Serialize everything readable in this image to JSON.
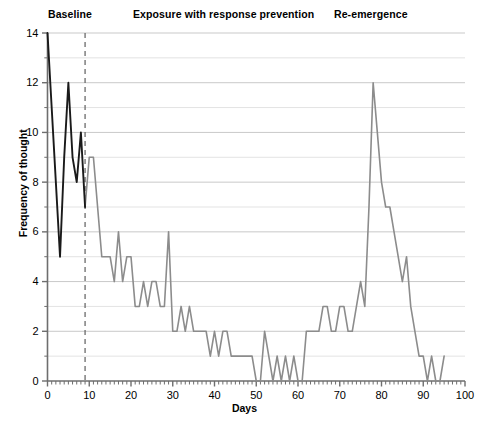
{
  "chart_data": {
    "type": "line",
    "title": "",
    "xlabel": "Days",
    "ylabel": "Frequency of thought",
    "xlim": [
      0,
      100
    ],
    "ylim": [
      0,
      14
    ],
    "xticks": [
      0,
      10,
      20,
      30,
      40,
      50,
      60,
      70,
      80,
      90,
      100
    ],
    "yticks": [
      0,
      2,
      4,
      6,
      8,
      10,
      12,
      14
    ],
    "y_minor_gridlines": [
      1,
      3,
      5,
      7,
      9,
      11,
      13
    ],
    "grid": "horizontal",
    "legend_position": "none",
    "annotations": [
      {
        "text": "Baseline",
        "x": 4,
        "position": "top"
      },
      {
        "text": "Exposure with response prevention",
        "x": 42,
        "position": "top"
      },
      {
        "text": "Re-emergence",
        "x": 80,
        "position": "top"
      }
    ],
    "phase_line": {
      "x": 9,
      "style": "dashed",
      "color": "#6b6b6b"
    },
    "series": [
      {
        "name": "Baseline",
        "color": "#1a1a1a",
        "x": [
          0,
          1,
          2,
          3,
          4,
          5,
          6,
          7,
          8,
          9
        ],
        "values": [
          14,
          11,
          8,
          5,
          9,
          12,
          9,
          8,
          10,
          7
        ]
      },
      {
        "name": "Exposure with response prevention and Re-emergence",
        "color": "#8c8c8c",
        "x": [
          9,
          10,
          11,
          12,
          13,
          14,
          15,
          16,
          17,
          18,
          19,
          20,
          21,
          22,
          23,
          24,
          25,
          26,
          27,
          28,
          29,
          30,
          31,
          32,
          33,
          34,
          35,
          36,
          37,
          38,
          39,
          40,
          41,
          42,
          43,
          44,
          45,
          46,
          47,
          48,
          49,
          50,
          51,
          52,
          53,
          54,
          55,
          56,
          57,
          58,
          59,
          60,
          61,
          62,
          63,
          64,
          65,
          66,
          67,
          68,
          69,
          70,
          71,
          72,
          73,
          74,
          75,
          76,
          77,
          78,
          79,
          80,
          81,
          82,
          83,
          84,
          85,
          86,
          87,
          88,
          89,
          90,
          91,
          92,
          93,
          94,
          95
        ],
        "values": [
          7,
          9,
          9,
          7,
          5,
          5,
          5,
          4,
          6,
          4,
          5,
          5,
          3,
          3,
          4,
          3,
          4,
          4,
          3,
          3,
          6,
          2,
          2,
          3,
          2,
          3,
          2,
          2,
          2,
          2,
          1,
          2,
          1,
          2,
          2,
          1,
          1,
          1,
          1,
          1,
          1,
          0,
          0,
          2,
          1,
          0,
          1,
          0,
          1,
          0,
          1,
          0,
          0,
          2,
          2,
          2,
          2,
          3,
          3,
          2,
          2,
          3,
          3,
          2,
          2,
          3,
          4,
          3,
          7,
          12,
          10,
          8,
          7,
          7,
          6,
          5,
          4,
          5,
          3,
          2,
          1,
          1,
          0,
          1,
          0,
          0,
          1
        ]
      }
    ]
  }
}
